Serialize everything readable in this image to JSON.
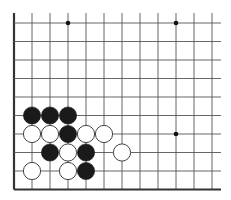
{
  "board": {
    "description": "Go board corner diagram (lower-left corner shown)",
    "origin_x": 14,
    "origin_y": 23,
    "spacing_x": 18,
    "spacing_y": 18.5,
    "cols": 12,
    "rows": 10,
    "line_color": "#555555",
    "edge_color": "#333333",
    "stone_radius": 8.6,
    "left_edge": true,
    "bottom_edge": true,
    "grid_top_extent": 13,
    "grid_right_extent": 221,
    "star_points": [
      {
        "col": 3,
        "row": 0
      },
      {
        "col": 9,
        "row": 0
      },
      {
        "col": 9,
        "row": 6
      }
    ],
    "stones": [
      {
        "color": "black",
        "col": 1,
        "row": 5
      },
      {
        "color": "black",
        "col": 2,
        "row": 5
      },
      {
        "color": "black",
        "col": 3,
        "row": 5
      },
      {
        "color": "white",
        "col": 1,
        "row": 6
      },
      {
        "color": "white",
        "col": 2,
        "row": 6
      },
      {
        "color": "black",
        "col": 3,
        "row": 6
      },
      {
        "color": "white",
        "col": 4,
        "row": 6
      },
      {
        "color": "white",
        "col": 5,
        "row": 6
      },
      {
        "color": "black",
        "col": 2,
        "row": 7
      },
      {
        "color": "white",
        "col": 3,
        "row": 7
      },
      {
        "color": "black",
        "col": 4,
        "row": 7
      },
      {
        "color": "white",
        "col": 6,
        "row": 7
      },
      {
        "color": "white",
        "col": 1,
        "row": 8
      },
      {
        "color": "white",
        "col": 3,
        "row": 8
      },
      {
        "color": "black",
        "col": 4,
        "row": 8
      }
    ]
  }
}
